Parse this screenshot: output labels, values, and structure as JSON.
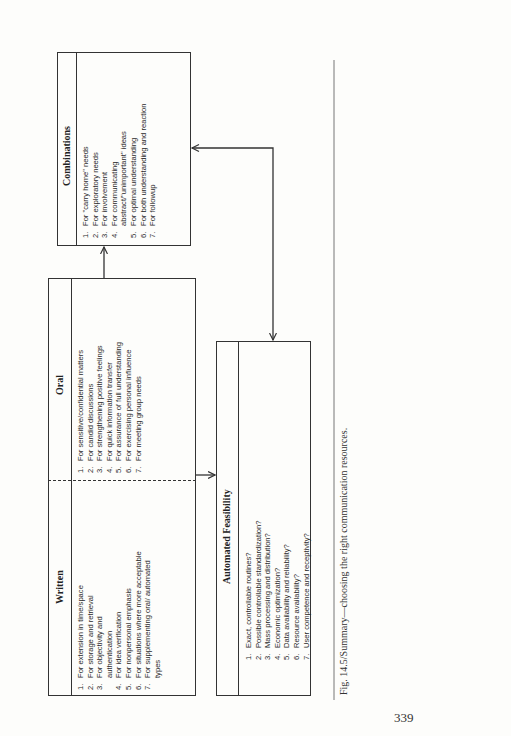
{
  "figure": {
    "caption": "Fig. 14.5/Summary—choosing the right communication resources.",
    "page_number": "339"
  },
  "written": {
    "title": "Written",
    "items": [
      {
        "num": "1.",
        "text": "For extension in time/space"
      },
      {
        "num": "2.",
        "text": "For storage and retrieval"
      },
      {
        "num": "3.",
        "text": "For objectivity and authentication"
      },
      {
        "num": "4.",
        "text": "For idea verification"
      },
      {
        "num": "5.",
        "text": "For nonpersonal emphasis"
      },
      {
        "num": "6.",
        "text": "For situations where more acceptable"
      },
      {
        "num": "7.",
        "text": "For supplementing oral/ automated types"
      }
    ]
  },
  "oral": {
    "title": "Oral",
    "items": [
      {
        "num": "1.",
        "text": "For sensitive/confidential matters"
      },
      {
        "num": "2.",
        "text": "For candid discussions"
      },
      {
        "num": "3.",
        "text": "For strengthening positive feelings"
      },
      {
        "num": "4.",
        "text": "For quick information transfer"
      },
      {
        "num": "5.",
        "text": "For assurance of full understanding"
      },
      {
        "num": "6.",
        "text": "For exercising personal influence"
      },
      {
        "num": "7.",
        "text": "For meeting group needs"
      }
    ]
  },
  "combinations": {
    "title": "Combinations",
    "items": [
      {
        "num": "1.",
        "text": "For \"carry home\" needs"
      },
      {
        "num": "2.",
        "text": "For exploratory needs"
      },
      {
        "num": "3.",
        "text": "For involvement"
      },
      {
        "num": "4.",
        "text": "For communicating abstract/\"unimportant\" ideas"
      },
      {
        "num": "5.",
        "text": "For optimal understanding"
      },
      {
        "num": "6.",
        "text": "For both understanding and reaction"
      },
      {
        "num": "7.",
        "text": "For followup"
      }
    ]
  },
  "automated": {
    "title": "Automated Feasibility",
    "items": [
      {
        "num": "1.",
        "text": "Exact, controllable routines?"
      },
      {
        "num": "2.",
        "text": "Possible controllable standardization?"
      },
      {
        "num": "3.",
        "text": "Mass processing and distribution?"
      },
      {
        "num": "4.",
        "text": "Economic optimization?"
      },
      {
        "num": "5.",
        "text": "Data availability and reliability?"
      },
      {
        "num": "6.",
        "text": "Resource availability?"
      },
      {
        "num": "7.",
        "text": "User competence and receptivity?"
      }
    ]
  },
  "connectors": [
    {
      "from": "written",
      "to": "automated",
      "type": "arrow"
    },
    {
      "from": "oral",
      "to": "combinations",
      "type": "arrow"
    },
    {
      "from": "combinations",
      "to": "automated",
      "type": "bidirectional-arrow"
    }
  ]
}
